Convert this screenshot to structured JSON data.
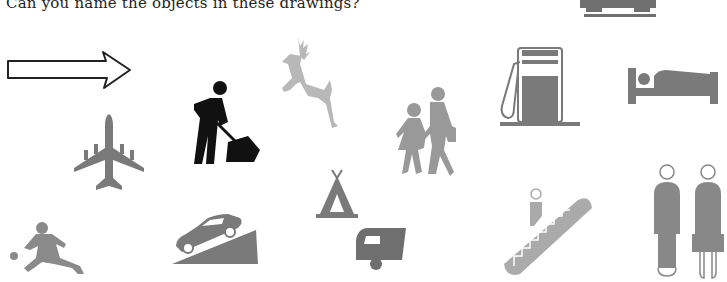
{
  "heading": "Can you name the objects in these drawings?",
  "colors": {
    "dark_gray": "#7a7a7a",
    "light_gray": "#b8b8b8",
    "black": "#111111",
    "outline": "#222222"
  },
  "drawings": [
    {
      "name": "car-partial",
      "icon": "car-icon"
    },
    {
      "name": "arrow-right",
      "icon": "arrow-right-icon"
    },
    {
      "name": "road-worker",
      "icon": "road-works-icon"
    },
    {
      "name": "deer",
      "icon": "deer-icon"
    },
    {
      "name": "children-crossing",
      "icon": "children-icon"
    },
    {
      "name": "petrol-pump",
      "icon": "fuel-pump-icon"
    },
    {
      "name": "bed",
      "icon": "bed-icon"
    },
    {
      "name": "airplane",
      "icon": "airplane-icon"
    },
    {
      "name": "footballer",
      "icon": "football-player-icon"
    },
    {
      "name": "steep-hill",
      "icon": "steep-hill-icon"
    },
    {
      "name": "tent",
      "icon": "tent-icon"
    },
    {
      "name": "caravan",
      "icon": "caravan-icon"
    },
    {
      "name": "escalator",
      "icon": "escalator-icon"
    },
    {
      "name": "man-and-woman",
      "icon": "toilets-icon"
    }
  ]
}
